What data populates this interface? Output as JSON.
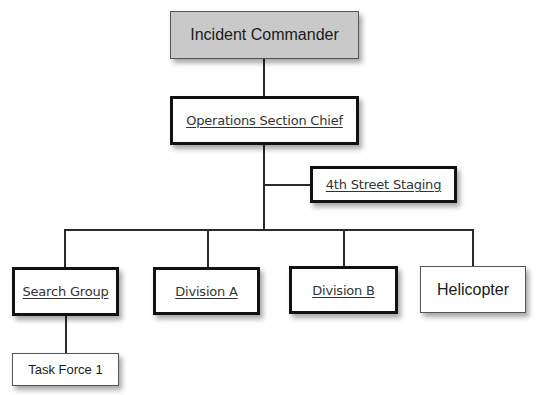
{
  "org_chart": {
    "incident_commander": {
      "label": "Incident Commander",
      "fill": "#c9c9c9",
      "style": "plain"
    },
    "operations_section_chief": {
      "label": "Operations Section Chief",
      "style": "underlined-bold-border"
    },
    "staging_area": {
      "label": "4th Street Staging",
      "style": "underlined-bold-border"
    },
    "units": [
      {
        "label": "Search Group",
        "style": "underlined-bold-border"
      },
      {
        "label": "Division A",
        "style": "underlined-bold-border"
      },
      {
        "label": "Division B",
        "style": "underlined-bold-border"
      },
      {
        "label": "Helicopter",
        "style": "plain"
      }
    ],
    "subunits": [
      {
        "label": "Task Force 1",
        "parent": "Search Group",
        "style": "plain"
      }
    ]
  }
}
